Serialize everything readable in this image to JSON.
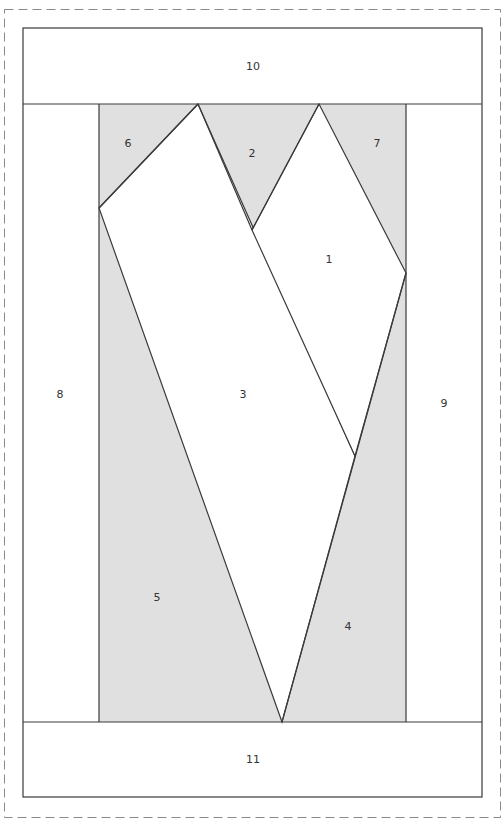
{
  "diagram": {
    "type": "paper-piecing-pattern",
    "colors": {
      "shaded": "#e0e0e0",
      "unshaded": "#ffffff",
      "line": "#3a3a3a",
      "dashed_border": "#8a8a8a"
    },
    "pieces": [
      {
        "id": "1",
        "label": "1",
        "shaded": false
      },
      {
        "id": "2",
        "label": "2",
        "shaded": true
      },
      {
        "id": "3",
        "label": "3",
        "shaded": false
      },
      {
        "id": "4",
        "label": "4",
        "shaded": true
      },
      {
        "id": "5",
        "label": "5",
        "shaded": true
      },
      {
        "id": "6",
        "label": "6",
        "shaded": true
      },
      {
        "id": "7",
        "label": "7",
        "shaded": true
      },
      {
        "id": "8",
        "label": "8",
        "shaded": false
      },
      {
        "id": "9",
        "label": "9",
        "shaded": false
      },
      {
        "id": "10",
        "label": "10",
        "shaded": false
      },
      {
        "id": "11",
        "label": "11",
        "shaded": false
      }
    ],
    "labels": {
      "p1": "1",
      "p2": "2",
      "p3": "3",
      "p4": "4",
      "p5": "5",
      "p6": "6",
      "p7": "7",
      "p8": "8",
      "p9": "9",
      "p10": "10",
      "p11": "11"
    }
  }
}
